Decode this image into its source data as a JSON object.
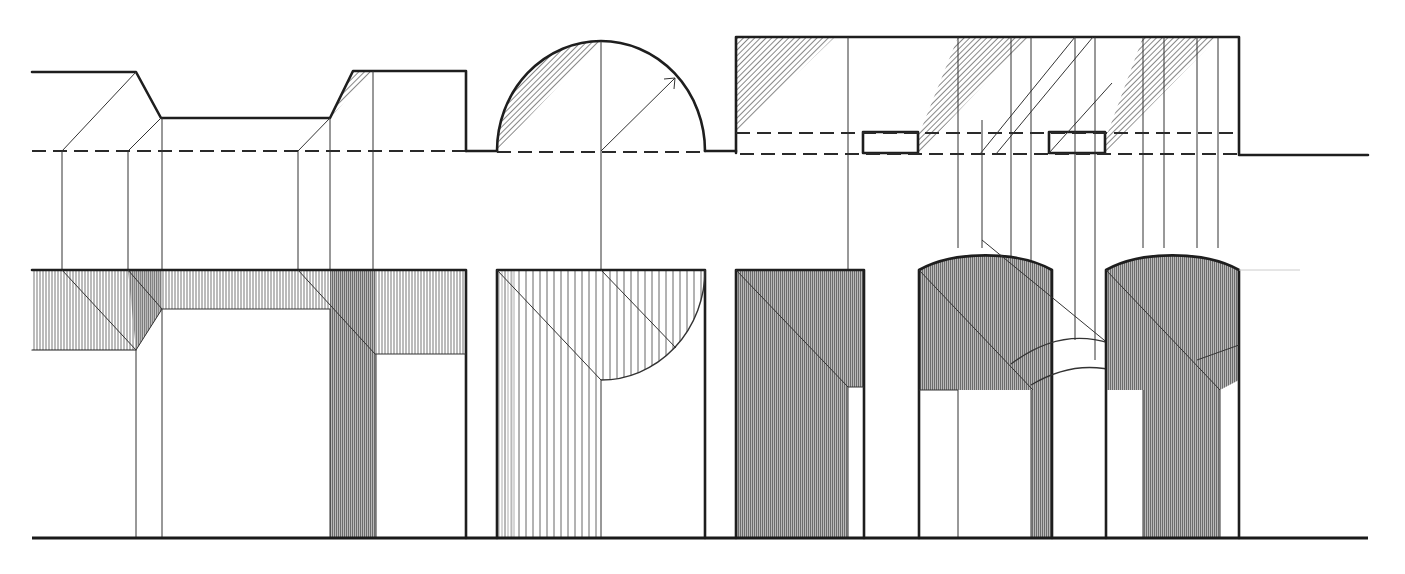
{
  "diagram": {
    "colors": {
      "line": "#1e1e1e",
      "hatch_light": "#8a8a8a",
      "hatch_dark": "#555555",
      "background": "#ffffff"
    },
    "sections": [
      {
        "id": "stepped-wall",
        "label": "Stepped wall with chamfered recess",
        "plan": "profile with angled returns",
        "elevation": "horizontal shadow band with recess pier shadow"
      },
      {
        "id": "semicircular-niche",
        "label": "Semicircular niche",
        "plan": "half-circle",
        "elevation": "shadow bounded by curve"
      },
      {
        "id": "arcade",
        "label": "Wall with piers and arched openings",
        "plan": "rectangle with two pier blocks",
        "elevation": "rectangular pier plus two arched bays"
      }
    ]
  }
}
